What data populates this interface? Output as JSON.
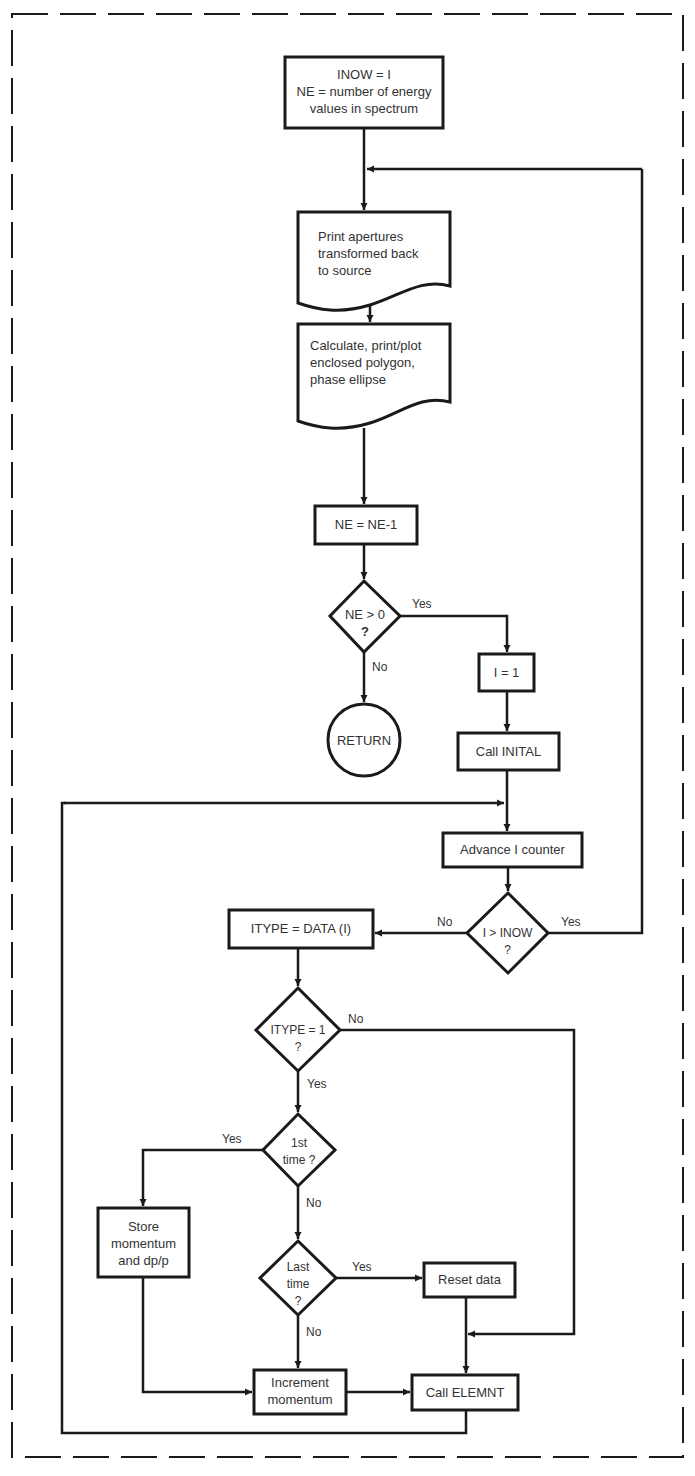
{
  "diagram": {
    "type": "flowchart",
    "border_style": "dashed",
    "nodes": {
      "init": {
        "shape": "process",
        "lines": [
          "INOW = I",
          "NE = number of energy",
          "values in spectrum"
        ]
      },
      "print_ap": {
        "shape": "document",
        "lines": [
          "Print apertures",
          "transformed back",
          "to source"
        ]
      },
      "calc": {
        "shape": "document",
        "lines": [
          "Calculate, print/plot",
          "enclosed polygon,",
          "phase ellipse"
        ]
      },
      "ne_dec": {
        "shape": "process",
        "lines": [
          "NE = NE-1"
        ]
      },
      "ne_gt0": {
        "shape": "decision",
        "lines": [
          "NE > 0",
          "?"
        ]
      },
      "ret": {
        "shape": "terminal",
        "lines": [
          "RETURN"
        ]
      },
      "i_eq1": {
        "shape": "process",
        "lines": [
          "I = 1"
        ]
      },
      "call_inital": {
        "shape": "process",
        "lines": [
          "Call INITAL"
        ]
      },
      "adv_i": {
        "shape": "process",
        "lines": [
          "Advance I counter"
        ]
      },
      "i_gt_inow": {
        "shape": "decision",
        "lines": [
          "I > INOW",
          "?"
        ]
      },
      "itype_data": {
        "shape": "process",
        "lines": [
          "ITYPE = DATA (I)"
        ]
      },
      "itype_eq1": {
        "shape": "decision",
        "lines": [
          "ITYPE = 1",
          "?"
        ]
      },
      "first_time": {
        "shape": "decision",
        "lines": [
          "1st",
          "time ?"
        ]
      },
      "store": {
        "shape": "process",
        "lines": [
          "Store",
          "momentum",
          "and dp/p"
        ]
      },
      "last_time": {
        "shape": "decision",
        "lines": [
          "Last",
          "time",
          "?"
        ]
      },
      "reset": {
        "shape": "process",
        "lines": [
          "Reset data"
        ]
      },
      "increment": {
        "shape": "process",
        "lines": [
          "Increment",
          "momentum"
        ]
      },
      "elemnt": {
        "shape": "process",
        "lines": [
          "Call ELEMNT"
        ]
      }
    },
    "edge_labels": {
      "ne_yes": "Yes",
      "ne_no": "No",
      "inow_no": "No",
      "inow_yes": "Yes",
      "itype_no": "No",
      "itype_yes": "Yes",
      "first_yes": "Yes",
      "first_no": "No",
      "last_yes": "Yes",
      "last_no": "No"
    },
    "edges": [
      [
        "init",
        "print_ap"
      ],
      [
        "print_ap",
        "calc"
      ],
      [
        "calc",
        "ne_dec"
      ],
      [
        "ne_dec",
        "ne_gt0"
      ],
      [
        "ne_gt0",
        "i_eq1",
        "Yes"
      ],
      [
        "ne_gt0",
        "ret",
        "No"
      ],
      [
        "i_eq1",
        "call_inital"
      ],
      [
        "call_inital",
        "adv_i"
      ],
      [
        "adv_i",
        "i_gt_inow"
      ],
      [
        "i_gt_inow",
        "itype_data",
        "No"
      ],
      [
        "i_gt_inow",
        "print_ap",
        "Yes"
      ],
      [
        "itype_data",
        "itype_eq1"
      ],
      [
        "itype_eq1",
        "first_time",
        "Yes"
      ],
      [
        "itype_eq1",
        "elemnt",
        "No"
      ],
      [
        "first_time",
        "store",
        "Yes"
      ],
      [
        "first_time",
        "last_time",
        "No"
      ],
      [
        "last_time",
        "reset",
        "Yes"
      ],
      [
        "last_time",
        "increment",
        "No"
      ],
      [
        "store",
        "increment"
      ],
      [
        "increment",
        "elemnt"
      ],
      [
        "reset",
        "elemnt"
      ],
      [
        "elemnt",
        "adv_i"
      ]
    ]
  }
}
